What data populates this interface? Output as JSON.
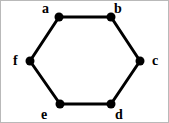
{
  "figure": {
    "kind": "hexagon-graph-diagram",
    "background_color": "#ffffff",
    "stroke_color": "#000000",
    "border_color": "#b9b9b9",
    "edge_width": 3,
    "vertex_radius": 4.5,
    "width": 169,
    "height": 123
  },
  "vertices": [
    {
      "id": "a",
      "label": "a",
      "x": 58,
      "y": 16,
      "label_x": 41,
      "label_y": 1
    },
    {
      "id": "b",
      "label": "b",
      "x": 110,
      "y": 16,
      "label_x": 113,
      "label_y": 1
    },
    {
      "id": "c",
      "label": "c",
      "x": 139,
      "y": 60,
      "label_x": 151,
      "label_y": 53
    },
    {
      "id": "d",
      "label": "d",
      "x": 110,
      "y": 103,
      "label_x": 114,
      "label_y": 107
    },
    {
      "id": "e",
      "label": "e",
      "x": 59,
      "y": 103,
      "label_x": 40,
      "label_y": 107
    },
    {
      "id": "f",
      "label": "f",
      "x": 29,
      "y": 60,
      "label_x": 12,
      "label_y": 53
    }
  ],
  "edges": [
    {
      "from": "a",
      "to": "b"
    },
    {
      "from": "b",
      "to": "c"
    },
    {
      "from": "c",
      "to": "d"
    },
    {
      "from": "d",
      "to": "e"
    },
    {
      "from": "e",
      "to": "f"
    },
    {
      "from": "f",
      "to": "a"
    }
  ]
}
